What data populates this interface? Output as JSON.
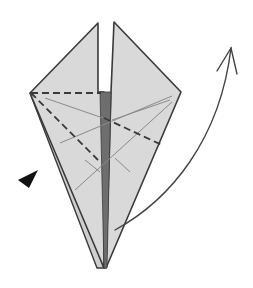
{
  "diagram": {
    "type": "origami-fold-step",
    "colors": {
      "background": "#ffffff",
      "paper": "#d9d9d9",
      "paper_back": "#cfcfcf",
      "inner_dark": "#6e6e6e",
      "outline": "#3a3a3a",
      "crease_light": "#8a8a8a",
      "valley_dash": "#3a3a3a",
      "arrow": "#444444",
      "push_marker": "#111111"
    },
    "symbols": {
      "valley_fold": "dashed-line",
      "existing_crease": "thin-line",
      "push_arrow": "black-triangle",
      "fold_arrow": "curved-arrow"
    }
  }
}
